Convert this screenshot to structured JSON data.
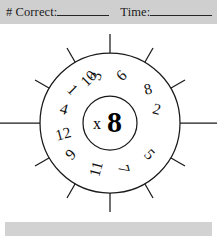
{
  "header": {
    "correct_label": "# Correct:",
    "time_label": "Time:",
    "correct_blank": "",
    "time_blank": ""
  },
  "wheel": {
    "center_operator": "x",
    "center_value": "8",
    "center_combined": "x8",
    "sector_count": 12,
    "numbers": [
      {
        "label": "3",
        "angle_deg": -75
      },
      {
        "label": "6",
        "angle_deg": -45
      },
      {
        "label": "8",
        "angle_deg": -15
      },
      {
        "label": "2",
        "angle_deg": 15
      },
      {
        "label": "5",
        "angle_deg": 45
      },
      {
        "label": "7",
        "angle_deg": 75
      },
      {
        "label": "11",
        "angle_deg": 105
      },
      {
        "label": "9",
        "angle_deg": 135
      },
      {
        "label": "12",
        "angle_deg": 165
      },
      {
        "label": "4",
        "angle_deg": 195
      },
      {
        "label": "1",
        "angle_deg": 225
      },
      {
        "label": "10",
        "angle_deg": 255
      }
    ]
  },
  "footer": {
    "text": ""
  },
  "colors": {
    "header_band": "#cfcfcf",
    "footer_band": "#d2d2d2",
    "ink": "#1a1a1a",
    "page": "#ffffff"
  }
}
